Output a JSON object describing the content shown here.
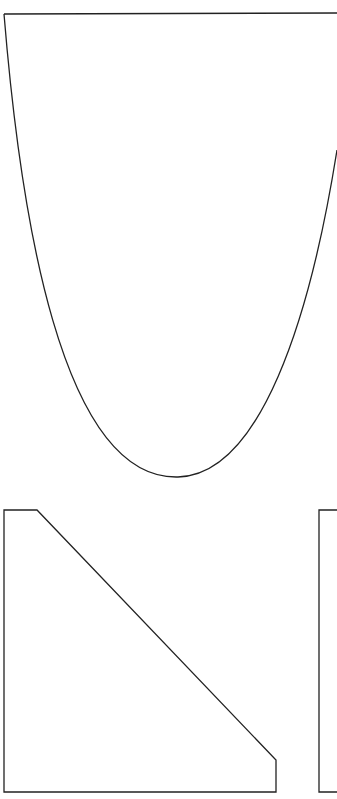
{
  "canvas": {
    "width": 337,
    "height": 799,
    "background": "#ffffff"
  },
  "stroke_color": "#222222",
  "shapes": [
    {
      "name": "parabola-cup-shape",
      "path": "M 4 14 L 337 13 M 4 14 C 20 210, 60 480, 178 477 C 260 475, 310 320, 337 150"
    },
    {
      "name": "chamfered-trapezoid-shape",
      "path": "M 4 510 L 37 510 L 276 760 L 276 792 L 4 792 Z"
    },
    {
      "name": "partial-rectangle-shape",
      "path": "M 337 510 L 319 510 L 319 792 L 337 792"
    }
  ]
}
